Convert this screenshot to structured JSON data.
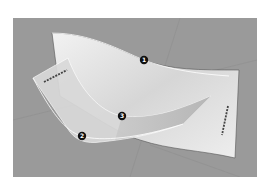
{
  "figure": {
    "type": "3d-surface-illustration",
    "background_color": "#9a9a9a",
    "surface_color": "#e4e4e4",
    "callouts": [
      {
        "number": "1",
        "x": 144,
        "y": 60
      },
      {
        "number": "2",
        "x": 82,
        "y": 136
      },
      {
        "number": "3",
        "x": 122,
        "y": 116
      }
    ],
    "markers": [
      {
        "name": "top-left-dash-marker"
      },
      {
        "name": "bottom-right-dash-marker"
      }
    ]
  }
}
